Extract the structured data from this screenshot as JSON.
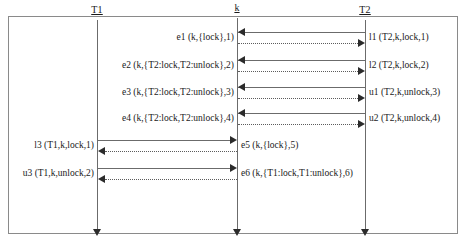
{
  "diagram": {
    "type": "uml-sequence-diagram",
    "frame": {
      "x": 8,
      "y": 16,
      "width": 450,
      "height": 218
    },
    "lifelines": [
      {
        "id": "T1",
        "label": "T1",
        "x": 97,
        "head_y": 6,
        "top": 20,
        "bottom": 233
      },
      {
        "id": "k",
        "label": "k",
        "x": 237,
        "head_y": 4,
        "top": 18,
        "bottom": 233
      },
      {
        "id": "T2",
        "label": "T2",
        "x": 365,
        "head_y": 6,
        "top": 20,
        "bottom": 233
      }
    ],
    "messages": [
      {
        "y": 32,
        "from": "T2",
        "to": "k",
        "style": "solid",
        "direction": "left",
        "label_left": "e1 (k,{lock},1)",
        "label_right": "l1 (T2,k,lock,1)"
      },
      {
        "y": 43,
        "from": "k",
        "to": "T2",
        "style": "dotted",
        "direction": "right",
        "label_left": "",
        "label_right": ""
      },
      {
        "y": 60,
        "from": "T2",
        "to": "k",
        "style": "solid",
        "direction": "left",
        "label_left": "e2 (k,{T2:lock,T2:unlock},2)",
        "label_right": "l2 (T2,k,lock,2)"
      },
      {
        "y": 71,
        "from": "k",
        "to": "T2",
        "style": "dotted",
        "direction": "right",
        "label_left": "",
        "label_right": ""
      },
      {
        "y": 87,
        "from": "T2",
        "to": "k",
        "style": "solid",
        "direction": "left",
        "label_left": "e3 (k,{T2:lock,T2:unlock},3)",
        "label_right": "u1 (T2,k,unlock,3)"
      },
      {
        "y": 98,
        "from": "k",
        "to": "T2",
        "style": "dotted",
        "direction": "right",
        "label_left": "",
        "label_right": ""
      },
      {
        "y": 113,
        "from": "T2",
        "to": "k",
        "style": "solid",
        "direction": "left",
        "label_left": "e4 (k,{T2:lock,T2:unlock},4)",
        "label_right": "u2 (T2,k,unlock,4)"
      },
      {
        "y": 124,
        "from": "k",
        "to": "T2",
        "style": "dotted",
        "direction": "right",
        "label_left": "",
        "label_right": ""
      },
      {
        "y": 140,
        "from": "T1",
        "to": "k",
        "style": "solid",
        "direction": "right",
        "label_left": "l3 (T1,k,lock,1)",
        "label_right": "e5 (k,{lock},5)"
      },
      {
        "y": 151,
        "from": "k",
        "to": "T1",
        "style": "dotted",
        "direction": "left",
        "label_left": "",
        "label_right": ""
      },
      {
        "y": 168,
        "from": "T1",
        "to": "k",
        "style": "solid",
        "direction": "right",
        "label_left": "u3 (T1,k,unlock,2)",
        "label_right": "e6 (k,{T1:lock,T1:unlock},6)"
      },
      {
        "y": 179,
        "from": "k",
        "to": "T1",
        "style": "dotted",
        "direction": "left",
        "label_left": "",
        "label_right": ""
      }
    ],
    "labels": {
      "e1": "e1 (k,{lock},1)",
      "e2": "e2 (k,{T2:lock,T2:unlock},2)",
      "e3": "e3 (k,{T2:lock,T2:unlock},3)",
      "e4": "e4 (k,{T2:lock,T2:unlock},4)",
      "e5": "e5 (k,{lock},5)",
      "e6": "e6 (k,{T1:lock,T1:unlock},6)",
      "l1": "l1 (T2,k,lock,1)",
      "l2": "l2 (T2,k,lock,2)",
      "l3": "l3 (T1,k,lock,1)",
      "u1": "u1 (T2,k,unlock,3)",
      "u2": "u2 (T2,k,unlock,4)",
      "u3": "u3 (T1,k,unlock,2)"
    },
    "colors": {
      "line": "#6b6b6b",
      "frame": "#8a8a8a",
      "text": "#1a1a1a",
      "arrow": "#2b2b2b",
      "background": "#ffffff"
    }
  }
}
